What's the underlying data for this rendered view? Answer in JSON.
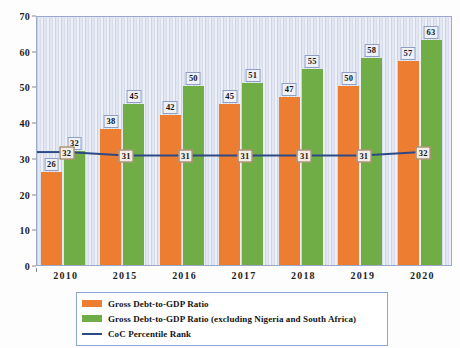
{
  "chart_data": {
    "type": "bar",
    "title": "",
    "subtitle": "",
    "xlabel": "",
    "ylabel": "",
    "categories": [
      "2010",
      "2015",
      "2016",
      "2017",
      "2018",
      "2019",
      "2020"
    ],
    "ylim": [
      0,
      70
    ],
    "ytick_step": 10,
    "yticks": [
      "0",
      "10",
      "20",
      "30",
      "40",
      "50",
      "60",
      "70"
    ],
    "grid": false,
    "legend_position": "bottom",
    "series": [
      {
        "name": "Gross Debt-to-GDP Ratio",
        "type": "bar",
        "color": "#ED7D31",
        "values": [
          26,
          38,
          42,
          45,
          47,
          50,
          57
        ],
        "labels": [
          "26",
          "38",
          "42",
          "45",
          "47",
          "50",
          "57"
        ]
      },
      {
        "name": "Gross Debt-to-GDP Ratio (excluding Nigeria and South Africa)",
        "type": "bar",
        "color": "#70AD47",
        "values": [
          32,
          45,
          50,
          51,
          55,
          58,
          63
        ],
        "labels": [
          "32",
          "45",
          "50",
          "51",
          "55",
          "58",
          "63"
        ]
      },
      {
        "name": "CoC Percentile Rank",
        "type": "line",
        "color": "#2E4A85",
        "values": [
          32,
          31,
          31,
          31,
          31,
          31,
          32
        ],
        "labels": [
          "32",
          "31",
          "31",
          "31",
          "31",
          "31",
          "32"
        ]
      }
    ]
  },
  "legend": {
    "items": [
      {
        "label": "Gross Debt-to-GDP Ratio",
        "swatch": "orange-swatch"
      },
      {
        "label": "Gross Debt-to-GDP Ratio (excluding Nigeria and South Africa)",
        "swatch": "green-swatch"
      },
      {
        "label": "CoC Percentile Rank",
        "swatch": "line-swatch"
      }
    ]
  },
  "colors": {
    "bar_orange": "#ED7D31",
    "bar_green": "#70AD47",
    "line_navy": "#2E4A85",
    "plot_background": "#DDE2EF",
    "plot_border": "#9AA8C9",
    "legend_border": "#8EA4D2"
  }
}
